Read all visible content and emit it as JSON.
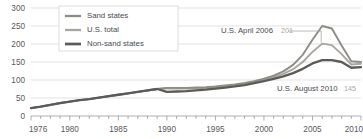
{
  "chart_data": {
    "type": "line",
    "title": "",
    "subtitle": "",
    "xlabel": "",
    "ylabel": "",
    "xlim": [
      1976,
      2010
    ],
    "ylim": [
      0,
      300
    ],
    "grid": true,
    "legend_position": "top-left",
    "y_ticks": [
      "0",
      "50",
      "100",
      "150",
      "200",
      "250",
      "300"
    ],
    "y_tick_values": [
      0,
      50,
      100,
      150,
      200,
      250,
      300
    ],
    "x_ticks": [
      "1976",
      "1980",
      "1985",
      "1990",
      "1995",
      "2000",
      "2005",
      "2010"
    ],
    "x_tick_values": [
      1976,
      1980,
      1985,
      1990,
      1995,
      2000,
      2005,
      2010
    ],
    "series": [
      {
        "name": "Sand states",
        "color": "#8f8c86",
        "width": 1.9,
        "x": [
          1976,
          1977,
          1978,
          1979,
          1980,
          1981,
          1982,
          1983,
          1984,
          1985,
          1986,
          1987,
          1988,
          1989,
          1990,
          1991,
          1992,
          1993,
          1994,
          1995,
          1996,
          1997,
          1998,
          1999,
          2000,
          2001,
          2002,
          2003,
          2004,
          2005,
          2006,
          2007,
          2008,
          2009,
          2010
        ],
        "values": [
          22,
          26,
          31,
          36,
          40,
          44,
          47,
          51,
          55,
          59,
          63,
          67,
          71,
          75,
          78,
          78,
          78,
          79,
          80,
          82,
          85,
          88,
          92,
          97,
          104,
          112,
          124,
          142,
          170,
          212,
          250,
          243,
          196,
          152,
          150
        ]
      },
      {
        "name": "U.S. total",
        "color": "#a9a6a0",
        "width": 1.9,
        "x": [
          1976,
          1977,
          1978,
          1979,
          1980,
          1981,
          1982,
          1983,
          1984,
          1985,
          1986,
          1987,
          1988,
          1989,
          1990,
          1991,
          1992,
          1993,
          1994,
          1995,
          1996,
          1997,
          1998,
          1999,
          2000,
          2001,
          2002,
          2003,
          2004,
          2005,
          2006,
          2007,
          2008,
          2009,
          2010
        ],
        "values": [
          22,
          26,
          31,
          36,
          40,
          44,
          47,
          51,
          55,
          59,
          63,
          67,
          71,
          75,
          77,
          76,
          76,
          77,
          78,
          80,
          83,
          86,
          90,
          95,
          101,
          108,
          117,
          130,
          150,
          178,
          201,
          197,
          172,
          143,
          145
        ]
      },
      {
        "name": "Non-sand states",
        "color": "#5c5a57",
        "width": 2.3,
        "x": [
          1976,
          1977,
          1978,
          1979,
          1980,
          1981,
          1982,
          1983,
          1984,
          1985,
          1986,
          1987,
          1988,
          1989,
          1990,
          1991,
          1992,
          1993,
          1994,
          1995,
          1996,
          1997,
          1998,
          1999,
          2000,
          2001,
          2002,
          2003,
          2004,
          2005,
          2006,
          2007,
          2008,
          2009,
          2010
        ],
        "values": [
          22,
          26,
          31,
          36,
          40,
          44,
          47,
          51,
          55,
          59,
          63,
          67,
          71,
          75,
          67,
          68,
          69,
          71,
          73,
          76,
          79,
          82,
          86,
          91,
          97,
          103,
          110,
          119,
          131,
          146,
          155,
          155,
          150,
          134,
          136
        ]
      }
    ],
    "branch_year": 1990,
    "annotations": [
      {
        "name": "us-april-2006",
        "label": "U.S. April 2006",
        "value": "201",
        "target_year": 2006,
        "target_value": 201
      },
      {
        "name": "us-august-2010",
        "label": "U.S. August 2010",
        "value": "145",
        "target_year": 2010,
        "target_value": 145
      }
    ]
  }
}
